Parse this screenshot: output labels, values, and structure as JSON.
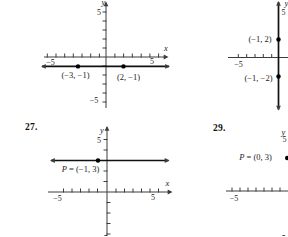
{
  "page": {
    "background": "#ffffff",
    "ink": "#1c1c1c",
    "axis_color": "#3c3c3c",
    "line_color": "#111111"
  },
  "chart_data": [
    {
      "id": "top-left",
      "problem_number": null,
      "type": "line",
      "depicts": "horizontal line y = -1 drawn through two labeled points",
      "line": {
        "orientation": "horizontal",
        "value": -1
      },
      "points": [
        {
          "x": -3,
          "y": -1,
          "label": "(-3, -1)"
        },
        {
          "x": 2,
          "y": -1,
          "label": "(2, -1)"
        }
      ],
      "axes": {
        "xlabel": "x",
        "ylabel": "y",
        "x_ticks_labeled": [
          -5,
          5
        ],
        "y_ticks_labeled": [
          5,
          -5
        ],
        "xlim": [
          -7,
          7
        ],
        "ylim": [
          -6,
          6
        ]
      },
      "layout": {
        "x_axis": {
          "y": 57,
          "x1": 44,
          "x2": 166.5,
          "arrow_start": false,
          "arrow_end": true,
          "ticks": [
            47.3,
            56,
            64.7,
            73.3,
            82,
            90.7,
            99.4,
            114.9,
            123.6,
            132.3,
            141.2,
            149.9,
            158.6
          ]
        },
        "y_axis": {
          "x": 106,
          "y1": 2.5,
          "y2": 108,
          "arrow_start": true,
          "arrow_end": false,
          "ticks_left": [
            12,
            21,
            30,
            39,
            48,
            66,
            75,
            84,
            93,
            102
          ],
          "ticks_right": []
        },
        "tick_labels": [
          {
            "text": "-5",
            "x": 50.5,
            "y": 62.5
          },
          {
            "text": "5",
            "x": 152,
            "y": 61.5
          },
          {
            "text": "5",
            "x": 99,
            "y": 12
          },
          {
            "text": "-5",
            "x": 94,
            "y": 100.5
          }
        ],
        "axis_letters": [
          {
            "text": "x",
            "x": 166,
            "y": 48
          },
          {
            "text": "y",
            "x": 103.5,
            "y": 1.5
          }
        ],
        "plot_line": {
          "x1": 42,
          "y1": 66.4,
          "x2": 169,
          "y2": 66.4
        },
        "points": [
          {
            "cx": 78,
            "cy": 66.4,
            "lx": 75.5,
            "ly": 75
          },
          {
            "cx": 123.5,
            "cy": 66.4,
            "lx": 128.5,
            "ly": 77
          }
        ]
      }
    },
    {
      "id": "top-right",
      "problem_number": null,
      "type": "line",
      "depicts": "vertical line x = -1 through two labeled points; figure cut off at right edge of crop",
      "line": {
        "orientation": "vertical",
        "value": -1
      },
      "points": [
        {
          "x": -1,
          "y": 2,
          "label": "(-1, 2)"
        },
        {
          "x": -1,
          "y": -2,
          "label": "(-1, -2)"
        }
      ],
      "axes": {
        "xlabel": null,
        "ylabel": "y",
        "x_ticks_labeled": [
          -5
        ],
        "y_ticks_labeled": [
          5
        ],
        "xlim": [
          -6,
          0
        ],
        "ylim": [
          -6,
          6
        ]
      },
      "layout": {
        "x_axis": {
          "y": 57.5,
          "x1": 228,
          "x2": 288,
          "arrow_start": false,
          "arrow_end": false,
          "ticks": [
            238.3,
            246.7,
            255,
            263.3,
            271.7
          ]
        },
        "tick_labels": [
          {
            "text": "-5",
            "x": 238.5,
            "y": 64
          },
          {
            "text": "5",
            "x": 283.5,
            "y": 12
          }
        ],
        "axis_letters": [
          {
            "text": "y",
            "x": 286.5,
            "y": 2.5
          }
        ],
        "plot_line": {
          "x1": 278.5,
          "y1": 2,
          "x2": 278.5,
          "y2": 109.5
        },
        "points": [
          {
            "cx": 278.5,
            "cy": 39.5,
            "lx": 260,
            "ly": 39
          },
          {
            "cx": 278.5,
            "cy": 76.5,
            "lx": 258.5,
            "ly": 77.5
          }
        ]
      }
    },
    {
      "id": "problem-27",
      "problem_number": "27.",
      "type": "line",
      "depicts": "horizontal line y = 3 through labeled point P",
      "line": {
        "orientation": "horizontal",
        "value": 3
      },
      "points": [
        {
          "x": -1,
          "y": 3,
          "label": "P = (-1, 3)"
        }
      ],
      "axes": {
        "xlabel": "x",
        "ylabel": "y",
        "x_ticks_labeled": [
          -5,
          5
        ],
        "y_ticks_labeled": [
          5,
          -5
        ],
        "xlim": [
          -7,
          7
        ],
        "ylim": [
          -5,
          6
        ]
      },
      "layout": {
        "x_axis": {
          "y": 192,
          "x1": 48,
          "x2": 170.5,
          "arrow_start": false,
          "arrow_end": true,
          "ticks": [
            63.5,
            72,
            80.5,
            89,
            97.5,
            116,
            124.5,
            133,
            141.5,
            150,
            158.5
          ]
        },
        "y_axis": {
          "x": 107,
          "y1": 127,
          "y2": 236,
          "arrow_start": true,
          "arrow_end": false,
          "ticks_left": [
            139.5,
            150,
            171,
            181.5
          ],
          "ticks_right": [
            202.5,
            213,
            223.5,
            234
          ]
        },
        "tick_labels": [
          {
            "text": "-5",
            "x": 57.5,
            "y": 198.5
          },
          {
            "text": "5",
            "x": 153,
            "y": 197.5
          },
          {
            "text": "5",
            "x": 99,
            "y": 140
          },
          {
            "text": "-5",
            "x": 103.5,
            "y": 238
          }
        ],
        "axis_letters": [
          {
            "text": "x",
            "x": 167.5,
            "y": 183
          },
          {
            "text": "y",
            "x": 102,
            "y": 130
          }
        ],
        "plot_line": {
          "x1": 51,
          "y1": 160.5,
          "x2": 168.5,
          "y2": 160.5
        },
        "points": [
          {
            "cx": 98,
            "cy": 160.5,
            "lx": 80.5,
            "ly": 168.5
          }
        ]
      }
    },
    {
      "id": "problem-29",
      "problem_number": "29.",
      "type": "point",
      "depicts": "point P = (0, 3) plotted on the y-axis; figure cut off at right edge of crop",
      "line": null,
      "points": [
        {
          "x": 0,
          "y": 3,
          "label": "P = (0, 3)"
        }
      ],
      "axes": {
        "xlabel": null,
        "ylabel": "y",
        "x_ticks_labeled": [
          -5
        ],
        "y_ticks_labeled": [
          5,
          -5
        ],
        "xlim": [
          -6,
          0
        ],
        "ylim": [
          -5,
          6
        ]
      },
      "layout": {
        "x_axis": {
          "y": 191,
          "x1": 226,
          "x2": 288,
          "arrow_start": false,
          "arrow_end": false,
          "ticks": [
            232,
            240,
            248,
            256,
            264,
            272,
            280
          ]
        },
        "tick_labels": [
          {
            "text": "-5",
            "x": 234,
            "y": 198.5
          },
          {
            "text": "5",
            "x": 284.5,
            "y": 139.5
          },
          {
            "text": "-5",
            "x": 281.5,
            "y": 238.5
          }
        ],
        "axis_letters": [
          {
            "text": "y",
            "x": 283.5,
            "y": 132
          }
        ],
        "plot_line": null,
        "points": [
          {
            "cx": 287.2,
            "cy": 158,
            "lx": 255.5,
            "ly": 157
          }
        ]
      }
    }
  ]
}
